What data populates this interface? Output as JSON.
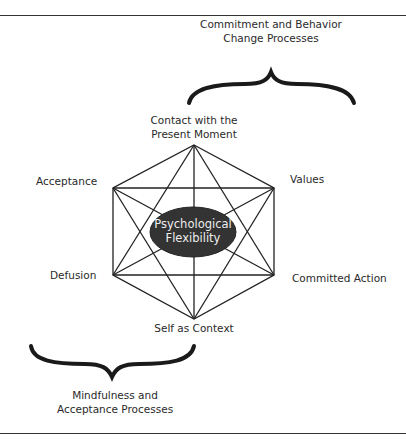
{
  "diagram": {
    "title_center": [
      "Psychological",
      "Flexibility"
    ],
    "nodes": {
      "top": [
        "Contact with the",
        "Present Moment"
      ],
      "upper_left": "Acceptance",
      "upper_right": "Values",
      "lower_left": "Defusion",
      "lower_right": "Committed Action",
      "bottom": "Self as Context"
    },
    "groups": {
      "top_right": [
        "Commitment and Behavior",
        "Change Processes"
      ],
      "bottom_left": [
        "Mindfulness and",
        "Acceptance Processes"
      ]
    },
    "colors": {
      "line": "#222222",
      "ellipse_fill": "#333333",
      "ellipse_text": "#eeeeee"
    }
  }
}
